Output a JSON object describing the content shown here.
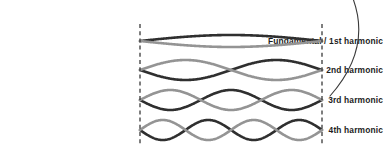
{
  "figure": {
    "background_color": "#ffffff",
    "width": 383,
    "height": 150
  },
  "labels": {
    "harmonic_1": "Fundamental / 1st harmonic",
    "harmonic_2": "2nd harmonic",
    "harmonic_3": "3rd harmonic",
    "harmonic_4": "4th harmonic"
  },
  "colors": {
    "wave_dark": "#2f2f2f",
    "wave_light": "#949494",
    "boundary_dash": "#3a3a3a",
    "arc": "#3a3a3a",
    "label_text": "#1d1d1d"
  },
  "chart_data": {
    "type": "line",
    "xlabel": "",
    "ylabel": "",
    "xlim": [
      0,
      1
    ],
    "ylim": [
      -1,
      1
    ],
    "grid": false,
    "legend": "none",
    "annotations": [
      "Left fixed end (node) shown as vertical dashed line",
      "Right fixed end (node) shown as vertical dashed line",
      "Each harmonic drawn as two mirrored envelopes: dark phase and light phase",
      "Thin arc at right edge"
    ],
    "boundaries": {
      "left_node_x": 140,
      "right_node_x": 322,
      "dash_top_y": 24,
      "dash_bottom_y": 146
    },
    "series": [
      {
        "name": "Fundamental / 1st harmonic",
        "antinodes": 1,
        "half_wavelengths": 1,
        "center_y": 41,
        "amplitude_px": 6,
        "phases": [
          {
            "name": "dark-phase",
            "sign": -1,
            "color": "#2f2f2f"
          },
          {
            "name": "light-phase",
            "sign": 1,
            "color": "#949494"
          }
        ]
      },
      {
        "name": "2nd harmonic",
        "antinodes": 2,
        "half_wavelengths": 2,
        "center_y": 70,
        "amplitude_px": 10,
        "phases": [
          {
            "name": "dark-phase",
            "sign": 1,
            "color": "#2f2f2f"
          },
          {
            "name": "light-phase",
            "sign": -1,
            "color": "#949494"
          }
        ]
      },
      {
        "name": "3rd harmonic",
        "antinodes": 3,
        "half_wavelengths": 3,
        "center_y": 100,
        "amplitude_px": 10,
        "phases": [
          {
            "name": "dark-phase",
            "sign": 1,
            "color": "#2f2f2f"
          },
          {
            "name": "light-phase",
            "sign": -1,
            "color": "#949494"
          }
        ]
      },
      {
        "name": "4th harmonic",
        "antinodes": 4,
        "half_wavelengths": 4,
        "center_y": 130,
        "amplitude_px": 10,
        "phases": [
          {
            "name": "dark-phase",
            "sign": 1,
            "color": "#2f2f2f"
          },
          {
            "name": "light-phase",
            "sign": -1,
            "color": "#949494"
          }
        ]
      }
    ]
  }
}
